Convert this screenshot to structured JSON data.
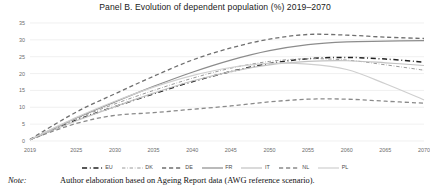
{
  "chart_data": {
    "type": "line",
    "title": "Panel B. Evolution of dependent population (%) 2019–2070",
    "xlabel": "",
    "ylabel": "",
    "x": [
      2019,
      2025,
      2030,
      2035,
      2040,
      2045,
      2050,
      2055,
      2060,
      2065,
      2070
    ],
    "xticklabels": [
      "2019",
      "2025",
      "2030",
      "2035",
      "2040",
      "2045",
      "2050",
      "2055",
      "2060",
      "2065",
      "2070"
    ],
    "yticklabels": [
      "0",
      "5",
      "10",
      "15",
      "20",
      "25",
      "30",
      "35"
    ],
    "ylim": [
      0,
      35
    ],
    "xlim": [
      2019,
      2070
    ],
    "ytick_step": 5,
    "grid": "horizontal",
    "legend_position": "bottom",
    "series": [
      {
        "name": "EU",
        "style": "dashdot",
        "color": "#222222",
        "width": 1.5,
        "values": [
          0.4,
          6.2,
          10.2,
          14.0,
          17.6,
          20.6,
          23.0,
          24.4,
          24.8,
          24.3,
          23.4
        ]
      },
      {
        "name": "DK",
        "style": "dashdot",
        "color": "#9a9a9a",
        "width": 1.0,
        "values": [
          0.4,
          6.6,
          11.0,
          15.0,
          18.6,
          21.6,
          23.6,
          24.4,
          24.0,
          22.6,
          21.0
        ]
      },
      {
        "name": "DE",
        "style": "dashed",
        "color": "#6f6f6f",
        "width": 1.3,
        "values": [
          0.5,
          8.6,
          14.0,
          19.2,
          24.0,
          27.6,
          30.2,
          31.6,
          31.4,
          30.8,
          30.4
        ]
      },
      {
        "name": "FR",
        "style": "solid",
        "color": "#8c8c8c",
        "width": 1.2,
        "values": [
          0.4,
          6.8,
          11.6,
          16.2,
          20.4,
          24.0,
          26.8,
          28.6,
          29.4,
          29.6,
          29.8
        ]
      },
      {
        "name": "IT",
        "style": "solid",
        "color": "#c2c2c2",
        "width": 1.2,
        "values": [
          0.4,
          6.0,
          10.2,
          14.2,
          17.8,
          20.6,
          22.6,
          23.6,
          23.8,
          23.2,
          22.4
        ]
      },
      {
        "name": "NL",
        "style": "dashed",
        "color": "#8a8a8a",
        "width": 1.3,
        "values": [
          0.4,
          5.2,
          7.6,
          8.4,
          9.4,
          10.4,
          11.6,
          12.4,
          12.4,
          11.8,
          11.2
        ]
      },
      {
        "name": "PL",
        "style": "solid",
        "color": "#cfcfcf",
        "width": 1.2,
        "values": [
          0.4,
          7.0,
          11.8,
          16.0,
          19.4,
          21.8,
          23.0,
          22.8,
          21.2,
          17.0,
          12.2
        ]
      }
    ]
  },
  "note": {
    "word": "Note:",
    "text": "Author elaboration based on Ageing Report data (AWG reference scenario)."
  }
}
